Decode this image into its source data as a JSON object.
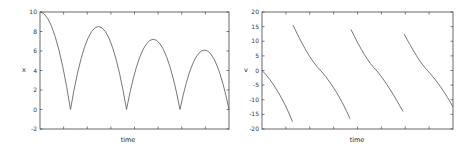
{
  "chart_data": [
    {
      "type": "line",
      "title": "",
      "xlabel": "time",
      "ylabel": "x",
      "ylim": [
        -2,
        10
      ],
      "yticks": [
        -2,
        0,
        2,
        4,
        6,
        8,
        10
      ],
      "xticks_labeled": false,
      "grid": false,
      "legend": null,
      "description": "Bouncing ball height: starts at 10, falls to 0, bounces with decreasing peaks",
      "key_points": [
        {
          "t_frac": 0.0,
          "x": 10
        },
        {
          "t_frac": 0.16,
          "x": 0
        },
        {
          "t_frac": 0.31,
          "x": 8.5
        },
        {
          "t_frac": 0.46,
          "x": 0
        },
        {
          "t_frac": 0.6,
          "x": 7.2
        },
        {
          "t_frac": 0.74,
          "x": 0
        },
        {
          "t_frac": 0.87,
          "x": 6.1
        },
        {
          "t_frac": 1.0,
          "x": 0
        }
      ]
    },
    {
      "type": "line",
      "title": "",
      "xlabel": "time",
      "ylabel": "v",
      "ylim": [
        -20,
        20
      ],
      "yticks": [
        -20,
        -15,
        -10,
        -5,
        0,
        5,
        10,
        15,
        20
      ],
      "xticks_labeled": false,
      "grid": false,
      "legend": null,
      "description": "Velocity of bouncing ball: sawtooth decreasing segments with jumps at bounces",
      "segments": [
        {
          "t_start_frac": 0.0,
          "v_start": 0,
          "t_end_frac": 0.16,
          "v_end": -17.5
        },
        {
          "t_start_frac": 0.16,
          "v_start": 15.5,
          "t_end_frac": 0.46,
          "v_end": -16.5
        },
        {
          "t_start_frac": 0.46,
          "v_start": 14,
          "t_end_frac": 0.74,
          "v_end": -14
        },
        {
          "t_start_frac": 0.74,
          "v_start": 12.5,
          "t_end_frac": 1.0,
          "v_end": -12.5
        }
      ]
    }
  ],
  "plots": {
    "left": {
      "ylabel": "x",
      "xlabel": "time",
      "yticks": [
        "10",
        "8",
        "6",
        "4",
        "2",
        "0",
        "-2"
      ]
    },
    "right": {
      "ylabel": "v",
      "xlabel": "time",
      "yticks": [
        "20",
        "15",
        "10",
        "5",
        "0",
        "-5",
        "-10",
        "-15",
        "-20"
      ]
    }
  }
}
